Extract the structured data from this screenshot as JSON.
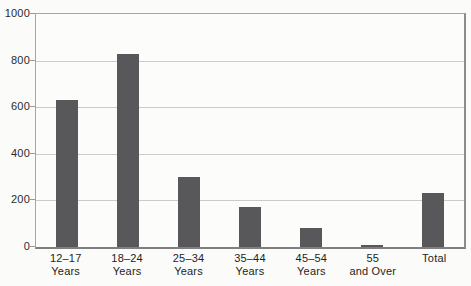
{
  "page": {
    "background_color": "#fbfbf9"
  },
  "chart_data": {
    "type": "bar",
    "title": "",
    "xlabel": "",
    "ylabel": "",
    "categories": [
      "12–17 Years",
      "18–24 Years",
      "25–34 Years",
      "35–44 Years",
      "45–54 Years",
      "55 and Over",
      "Total"
    ],
    "category_lines": [
      [
        "12–17",
        "Years"
      ],
      [
        "18–24",
        "Years"
      ],
      [
        "25–34",
        "Years"
      ],
      [
        "35–44",
        "Years"
      ],
      [
        "45–54",
        "Years"
      ],
      [
        "55",
        "and Over"
      ],
      [
        "Total"
      ]
    ],
    "values": [
      630,
      830,
      300,
      170,
      80,
      10,
      230
    ],
    "ylim": [
      0,
      1000
    ],
    "yticks": [
      0,
      200,
      400,
      600,
      800,
      1000
    ],
    "grid": true,
    "legend": false,
    "bar_color": "#58585a",
    "gridline_color": "#cbcbcb",
    "axis_color": "#8c8c8c",
    "tick_label_color": "#2b2b2b"
  }
}
